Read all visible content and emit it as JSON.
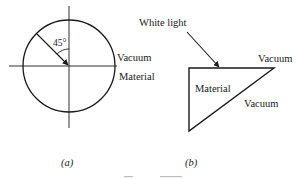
{
  "diagram": {
    "colors": {
      "stroke": "#1a1a1a",
      "background": "#ffffff",
      "faint_caption": "#bdbdbd"
    },
    "panel_a": {
      "caption": "(a)",
      "angle_label": "45°",
      "upper_region_label": "Vacuum",
      "lower_region_label": "Material",
      "elements": [
        "circle",
        "horizontal-axis",
        "vertical-axis",
        "incident-arrow-45deg",
        "angle-arc"
      ]
    },
    "panel_b": {
      "caption": "(b)",
      "incident_label": "White light",
      "prism_label": "Material",
      "top_right_label": "Vacuum",
      "hypotenuse_label": "Vacuum",
      "elements": [
        "right-triangle-prism",
        "incident-light-arrow"
      ]
    }
  }
}
